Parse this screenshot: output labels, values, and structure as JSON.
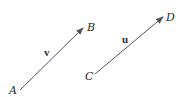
{
  "diagram": {
    "stroke_color": "#555555",
    "vectors": [
      {
        "name": "v",
        "label": "v",
        "start": {
          "label": "A",
          "x": 20,
          "y": 90
        },
        "end": {
          "label": "B",
          "x": 83,
          "y": 28
        }
      },
      {
        "name": "u",
        "label": "u",
        "start": {
          "label": "C",
          "x": 95,
          "y": 74
        },
        "end": {
          "label": "D",
          "x": 163,
          "y": 17
        }
      }
    ]
  }
}
